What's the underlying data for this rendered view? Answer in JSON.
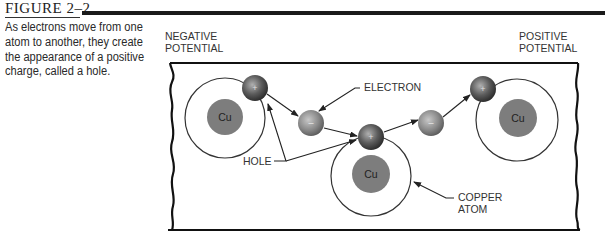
{
  "figure": {
    "title": "FIGURE 2–2",
    "caption": "As electrons move from one atom to another, they create the appearance of a positive charge, called a hole."
  },
  "diagram": {
    "labels": {
      "negative_potential_line1": "NEGATIVE",
      "negative_potential_line2": "POTENTIAL",
      "positive_potential_line1": "POSITIVE",
      "positive_potential_line2": "POTENTIAL",
      "electron": "ELECTRON",
      "hole": "HOLE",
      "copper_atom_line1": "COPPER",
      "copper_atom_line2": "ATOM"
    },
    "atoms": [
      {
        "symbol": "Cu"
      },
      {
        "symbol": "Cu"
      },
      {
        "symbol": "Cu"
      }
    ],
    "hole_sign": "+",
    "electron_sign": "–",
    "colors": {
      "nucleus": "#7d7d7d",
      "particle_dark": "#3a3a3a",
      "particle_light": "#9a9a9a",
      "line": "#222222"
    }
  }
}
